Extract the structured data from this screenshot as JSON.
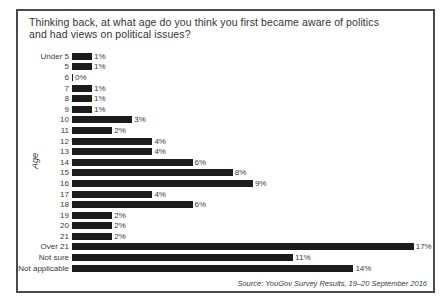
{
  "chart_data": {
    "type": "bar",
    "orientation": "horizontal",
    "title": "Thinking back, at what age do you think you first became aware of politics and had views on political issues?",
    "title_line1": "Thinking back, at what age do you think you first became aware of politics",
    "title_line2": "and had views on political issues?",
    "ylabel": "Age",
    "categories": [
      "Under 5",
      "5",
      "6",
      "7",
      "8",
      "9",
      "10",
      "11",
      "12",
      "13",
      "14",
      "15",
      "16",
      "17",
      "18",
      "19",
      "20",
      "21",
      "Over 21",
      "Not sure",
      "Not applicable"
    ],
    "values": [
      1,
      1,
      0,
      1,
      1,
      1,
      3,
      2,
      4,
      4,
      6,
      8,
      9,
      4,
      6,
      2,
      2,
      2,
      17,
      11,
      14
    ],
    "value_labels": [
      "1%",
      "1%",
      "0%",
      "1%",
      "1%",
      "1%",
      "3%",
      "2%",
      "4%",
      "4%",
      "6%",
      "8%",
      "9%",
      "4%",
      "6%",
      "2%",
      "2%",
      "2%",
      "17%",
      "11%",
      "14%"
    ],
    "xlim": [
      0,
      17
    ],
    "grid": false,
    "legend": false,
    "bar_color": "#1c1c1c",
    "text_color": "#3a3a3a",
    "source": "Source: YouGov Survey Results, 19–20 September 2016"
  }
}
